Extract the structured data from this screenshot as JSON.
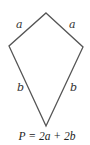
{
  "figure": {
    "shape": "kite",
    "stroke_color": "#555555",
    "vertices": {
      "top": [
        46,
        13
      ],
      "right": [
        83,
        47
      ],
      "bottom": [
        46,
        126
      ],
      "left": [
        9,
        46
      ]
    },
    "labels": {
      "upper_left": "a",
      "upper_right": "a",
      "lower_left": "b",
      "lower_right": "b"
    },
    "formula": "P = 2a + 2b"
  }
}
